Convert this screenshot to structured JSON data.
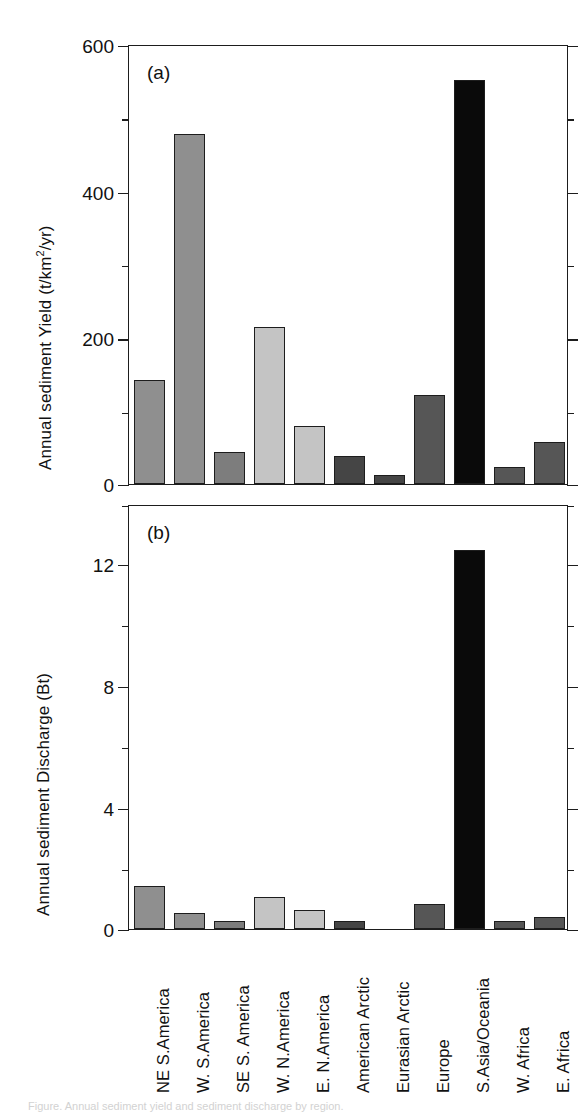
{
  "figure": {
    "panels": [
      {
        "letter": "(a)",
        "ylabel_main": "Annual sediment Yield (t/km",
        "ylabel_sup": "2",
        "ylabel_tail": "/yr)",
        "ylabel_full": "Annual sediment Yield (t/km2/yr)"
      },
      {
        "letter": "(b)",
        "ylabel_full": "Annual sediment Discharge (Bt)"
      }
    ],
    "caption": "Figure. Annual sediment yield and sediment discharge by region."
  },
  "axis_a": {
    "ticklabels": [
      "600",
      "400",
      "200",
      "0"
    ],
    "minor_values": [
      500,
      300,
      100
    ]
  },
  "axis_b": {
    "ticklabels": [
      "12",
      "8",
      "4",
      "0"
    ],
    "minor_values": [
      14,
      10,
      6,
      2
    ]
  },
  "chart_data": [
    {
      "type": "bar",
      "title": "(a)",
      "xlabel": "",
      "ylabel": "Annual sediment Yield (t/km2/yr)",
      "ylim": [
        0,
        600
      ],
      "yticks": [
        0,
        200,
        400,
        600
      ],
      "yticks_minor": [
        100,
        300,
        500
      ],
      "grid": false,
      "legend": "none",
      "categories": [
        "NE S.America",
        "W. S.America",
        "SE S. America",
        "W. N.America",
        "E. N.America",
        "American Arctic",
        "Eurasian Arctic",
        "Europe",
        "S.Asia/Oceania",
        "W. Africa",
        "E. Africa"
      ],
      "values": [
        143,
        481,
        44,
        216,
        79,
        38,
        12,
        122,
        555,
        24,
        58
      ],
      "colors": [
        "#8f8f8f",
        "#8f8f8f",
        "#7d7d7d",
        "#c4c4c4",
        "#c4c4c4",
        "#454545",
        "#454545",
        "#565656",
        "#0a0a0a",
        "#565656",
        "#565656"
      ]
    },
    {
      "type": "bar",
      "title": "(b)",
      "xlabel": "",
      "ylabel": "Annual sediment Discharge (Bt)",
      "ylim": [
        0,
        13.9
      ],
      "yticks": [
        0,
        4,
        8,
        12
      ],
      "yticks_minor": [
        2,
        6,
        10,
        14
      ],
      "grid": false,
      "legend": "none",
      "categories": [
        "NE S.America",
        "W. S.America",
        "SE S. America",
        "W. N.America",
        "E. N.America",
        "American Arctic",
        "Eurasian Arctic",
        "Europe",
        "S.Asia/Oceania",
        "W. Africa",
        "E. Africa"
      ],
      "values": [
        1.42,
        0.52,
        0.25,
        1.05,
        0.62,
        0.27,
        0.0,
        0.82,
        12.5,
        0.25,
        0.4
      ],
      "colors": [
        "#8f8f8f",
        "#8f8f8f",
        "#7d7d7d",
        "#c4c4c4",
        "#c4c4c4",
        "#454545",
        "#454545",
        "#565656",
        "#0a0a0a",
        "#565656",
        "#565656"
      ]
    }
  ]
}
